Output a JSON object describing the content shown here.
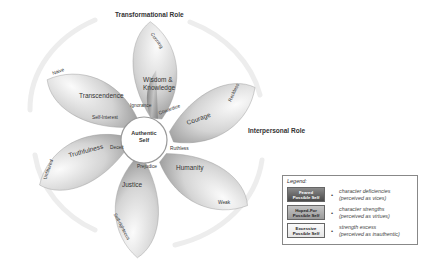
{
  "roles": {
    "top": "Transformational Role",
    "right": "Interpersonal Role"
  },
  "center": {
    "line1": "Authentic",
    "line2": "Self"
  },
  "petals": [
    {
      "virtue": "Wisdom &",
      "virtue2": "Knowledge",
      "vice": "Ignorance",
      "excess": "Cunning"
    },
    {
      "virtue": "Courage",
      "vice": "Cowardice",
      "excess": "Reckless"
    },
    {
      "virtue": "Humanity",
      "vice": "Ruthless",
      "excess": "Weak"
    },
    {
      "virtue": "Justice",
      "vice": "Prejudice",
      "excess": "Self-righteous"
    },
    {
      "virtue": "Truthfulness",
      "vice": "Deceit",
      "excess": "Unfiltered"
    },
    {
      "virtue": "Transcendence",
      "vice": "Self-Interest",
      "excess": "Naive"
    }
  ],
  "legend": {
    "title": "Legend:",
    "items": [
      {
        "swatch1": "Feared",
        "swatch2": "Possible Self",
        "bullet": "•",
        "line1": "character deficiencies",
        "line2": "(perceived as vices)"
      },
      {
        "swatch1": "Hoped-For",
        "swatch2": "Possible Self",
        "bullet": "•",
        "line1": "character strengths",
        "line2": "(perceived as virtues)"
      },
      {
        "swatch1": "Excessive",
        "swatch2": "Possible Self",
        "bullet": "•",
        "line1": "strength excess",
        "line2": "(perceived as inauthentic)"
      }
    ]
  }
}
